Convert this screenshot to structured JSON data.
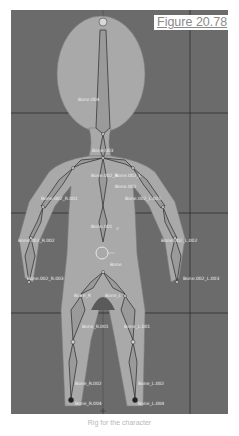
{
  "figure": {
    "label": "Figure 20.78",
    "caption": "Rig for the character"
  },
  "viewport": {
    "background_color": "#6b6b6b",
    "grid_color": "#2e2e2e",
    "mesh_color": "#a9a9a9",
    "bone_color": "#9a9a9a",
    "bone_outline_color": "#2a2a2a"
  },
  "bones": [
    {
      "name": "Bone.004",
      "x": 67,
      "y": 87
    },
    {
      "name": "Bone.003",
      "x": 81,
      "y": 138
    },
    {
      "name": "Bone.002_R",
      "x": 80,
      "y": 163
    },
    {
      "name": "Bone.002_L",
      "x": 104,
      "y": 163
    },
    {
      "name": "Bone.002",
      "x": 104,
      "y": 174
    },
    {
      "name": "Bone.002_R.001",
      "x": 30,
      "y": 186
    },
    {
      "name": "Bone.002_L.001",
      "x": 114,
      "y": 186
    },
    {
      "name": "Bone.001",
      "x": 80,
      "y": 214
    },
    {
      "name": "Bone.002_R.002",
      "x": 7,
      "y": 228
    },
    {
      "name": "Bone.002_L.002",
      "x": 150,
      "y": 228
    },
    {
      "name": "Bone",
      "x": 99,
      "y": 252
    },
    {
      "name": "Bone.002_R.003",
      "x": 16,
      "y": 266
    },
    {
      "name": "Bone.002_L.003",
      "x": 172,
      "y": 266
    },
    {
      "name": "Bone_R",
      "x": 63,
      "y": 283
    },
    {
      "name": "Bone_L",
      "x": 94,
      "y": 283
    },
    {
      "name": "Bone_R.001",
      "x": 71,
      "y": 314
    },
    {
      "name": "Bone_L.001",
      "x": 113,
      "y": 314
    },
    {
      "name": "Bone_R.002",
      "x": 64,
      "y": 371
    },
    {
      "name": "Bone_L.002",
      "x": 127,
      "y": 371
    },
    {
      "name": "Bone_R.004",
      "x": 64,
      "y": 391
    },
    {
      "name": "Bone_L.004",
      "x": 127,
      "y": 391
    }
  ]
}
